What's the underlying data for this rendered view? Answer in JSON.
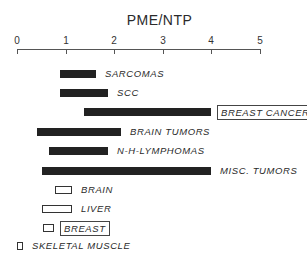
{
  "chart_data": {
    "type": "bar",
    "orientation": "horizontal-range",
    "title": "PME/NTP",
    "xlabel": "PME/NTP",
    "ylabel": "",
    "xlim": [
      0,
      5
    ],
    "xticks": [
      "0",
      "1",
      "2",
      "3",
      "4",
      "5"
    ],
    "grid": false,
    "legend": "none",
    "categories": [
      "SARCOMAS",
      "SCC",
      "BREAST CANCER",
      "BRAIN TUMORS",
      "N-H-LYMPHOMAS",
      "MISC. TUMORS",
      "BRAIN",
      "LIVER",
      "BREAST",
      "SKELETAL MUSCLE"
    ],
    "series": [
      {
        "name": "Tumors (filled bars)",
        "ranges": [
          {
            "category": "SARCOMAS",
            "min": 0.88,
            "max": 1.63
          },
          {
            "category": "SCC",
            "min": 0.88,
            "max": 1.87
          },
          {
            "category": "BREAST CANCER",
            "min": 1.38,
            "max": 3.99
          },
          {
            "category": "BRAIN TUMORS",
            "min": 0.41,
            "max": 2.14
          },
          {
            "category": "N-H-LYMPHOMAS",
            "min": 0.66,
            "max": 1.87
          },
          {
            "category": "MISC. TUMORS",
            "min": 0.51,
            "max": 3.99
          }
        ]
      },
      {
        "name": "Normal tissue (open bars)",
        "ranges": [
          {
            "category": "BRAIN",
            "min": 0.78,
            "max": 1.13
          },
          {
            "category": "LIVER",
            "min": 0.51,
            "max": 1.13
          },
          {
            "category": "BREAST",
            "min": 0.53,
            "max": 0.76
          },
          {
            "category": "SKELETAL MUSCLE",
            "min": 0.0,
            "max": 0.12
          }
        ]
      }
    ],
    "annotations": [
      "BREAST CANCER label boxed",
      "BREAST label boxed"
    ]
  },
  "axis": {
    "origin_px": 17,
    "px_per_unit": 48.6,
    "ticks": [
      "0",
      "1",
      "2",
      "3",
      "4",
      "5"
    ]
  },
  "rows": [
    {
      "label": "SARCOMAS",
      "min": 0.88,
      "max": 1.63,
      "filled": true,
      "boxed": false,
      "y": 70
    },
    {
      "label": "SCC",
      "min": 0.88,
      "max": 1.87,
      "filled": true,
      "boxed": false,
      "y": 89
    },
    {
      "label": "BREAST CANCER",
      "min": 1.38,
      "max": 3.99,
      "filled": true,
      "boxed": true,
      "y": 108
    },
    {
      "label": "BRAIN TUMORS",
      "min": 0.41,
      "max": 2.14,
      "filled": true,
      "boxed": false,
      "y": 128
    },
    {
      "label": "N-H-LYMPHOMAS",
      "min": 0.66,
      "max": 1.87,
      "filled": true,
      "boxed": false,
      "y": 147
    },
    {
      "label": "MISC. TUMORS",
      "min": 0.51,
      "max": 3.99,
      "filled": true,
      "boxed": false,
      "y": 167
    },
    {
      "label": "BRAIN",
      "min": 0.78,
      "max": 1.13,
      "filled": false,
      "boxed": false,
      "y": 186
    },
    {
      "label": "LIVER",
      "min": 0.51,
      "max": 1.13,
      "filled": false,
      "boxed": false,
      "y": 205
    },
    {
      "label": "BREAST",
      "min": 0.53,
      "max": 0.76,
      "filled": false,
      "boxed": true,
      "y": 224
    },
    {
      "label": "SKELETAL MUSCLE",
      "min": 0.0,
      "max": 0.12,
      "filled": false,
      "boxed": false,
      "y": 242
    }
  ],
  "colors": {
    "bar_fill": "#222222",
    "outline": "#333333",
    "background": "#ffffff"
  }
}
